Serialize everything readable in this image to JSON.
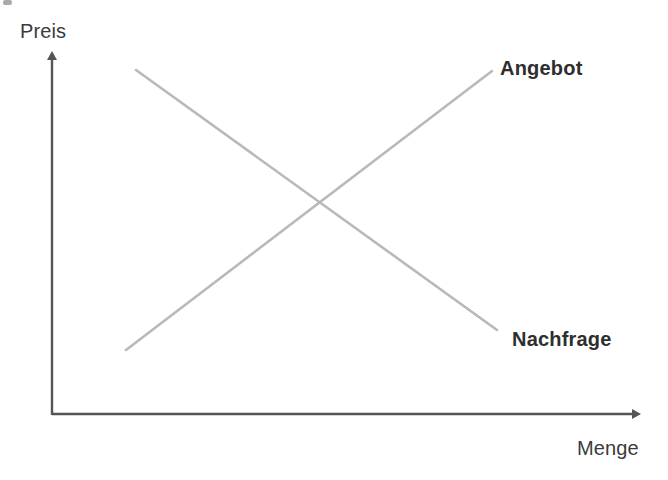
{
  "figure": {
    "background_color": "#ffffff",
    "axis_color": "#555555",
    "curve_color": "#b9b9b9",
    "label_color": "#3b3b3b",
    "curve_label_color": "#2e2e2e"
  },
  "axes": {
    "y_axis": {
      "label": "Preis",
      "icon": "arrow-up-icon",
      "origin": [
        52,
        415
      ],
      "tip": [
        52,
        52
      ]
    },
    "x_axis": {
      "label": "Menge",
      "icon": "arrow-right-icon",
      "origin": [
        52,
        415
      ],
      "tip": [
        641,
        414
      ]
    }
  },
  "chart_data": {
    "type": "line",
    "title": "",
    "xlabel": "Menge",
    "ylabel": "Preis",
    "grid": false,
    "legend": "inline-end-labels",
    "axis_units": "unlabeled (schematic)",
    "series": [
      {
        "name": "Angebot",
        "description": "upward sloping supply curve",
        "color": "#b9b9b9",
        "points": [
          [
            126,
            350
          ],
          [
            492,
            71
          ]
        ]
      },
      {
        "name": "Nachfrage",
        "description": "downward sloping demand curve",
        "color": "#b9b9b9",
        "points": [
          [
            136,
            70
          ],
          [
            497,
            330
          ]
        ]
      }
    ],
    "intersection": {
      "label": "",
      "point": [
        318,
        203
      ]
    }
  },
  "labels": {
    "supply": "Angebot",
    "demand": "Nachfrage",
    "y_axis": "Preis",
    "x_axis": "Menge"
  }
}
